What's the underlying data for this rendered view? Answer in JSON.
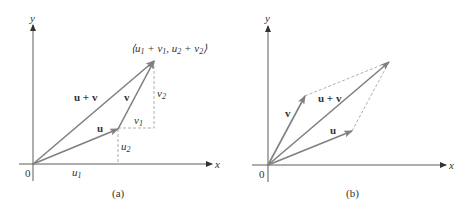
{
  "colors": {
    "axis": "#333333",
    "vector": "#808080",
    "dashed": "#9a9a9a",
    "text": "#333333"
  },
  "panel_a": {
    "caption": "(a)",
    "axis_x_label": "x",
    "axis_y_label": "y",
    "origin_label": "0",
    "sum_point_label_parts": [
      "⟨u",
      "1",
      " + v",
      "1",
      ", u",
      "2",
      " + v",
      "2",
      "⟩"
    ],
    "label_u": "u",
    "label_v": "v",
    "label_sum": "u + v",
    "comp_u1": "u",
    "comp_u1_sub": "1",
    "comp_u2": "u",
    "comp_u2_sub": "2",
    "comp_v1": "v",
    "comp_v1_sub": "1",
    "comp_v2": "v",
    "comp_v2_sub": "2"
  },
  "panel_b": {
    "caption": "(b)",
    "axis_x_label": "x",
    "axis_y_label": "y",
    "origin_label": "0",
    "label_u": "u",
    "label_v": "v",
    "label_sum": "u + v"
  }
}
